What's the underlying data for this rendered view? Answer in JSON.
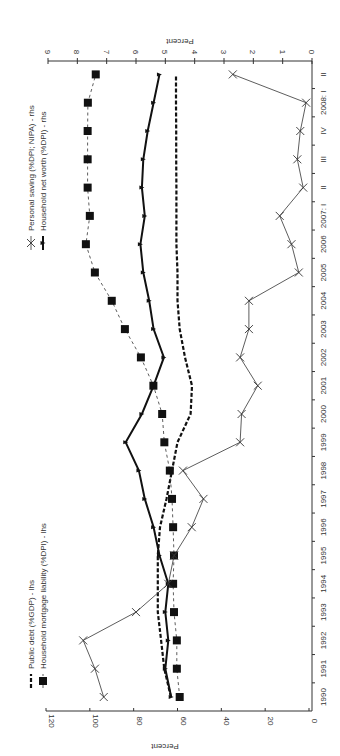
{
  "chart_data": {
    "type": "line",
    "orientation": "rotated-90-clockwise",
    "title": "",
    "categories": [
      "1990",
      "1991",
      "1992",
      "1993",
      "1994",
      "1995",
      "1996",
      "1997",
      "1998",
      "1999",
      "2000",
      "2001",
      "2002",
      "2003",
      "2004",
      "2005",
      "2006",
      "2007: I",
      "II",
      "III",
      "IV",
      "2008: I",
      "II"
    ],
    "left_axis": {
      "label": "Percent",
      "range": [
        0,
        120
      ],
      "ticks": [
        "0",
        "20",
        "40",
        "60",
        "80",
        "100",
        "120"
      ]
    },
    "right_axis": {
      "label": "Percent",
      "range": [
        0,
        9
      ],
      "ticks": [
        "0",
        "1",
        "2",
        "3",
        "4",
        "5",
        "6",
        "7",
        "8",
        "9"
      ]
    },
    "series": [
      {
        "name": "Public debt (%GDP) - lhs",
        "axis": "left",
        "style": "thick-dashed",
        "marker": "none",
        "values": [
          63,
          66,
          67.5,
          69,
          69,
          69,
          68,
          65,
          62.5,
          60,
          54,
          53.4,
          56.6,
          59,
          60,
          60,
          60.5,
          60.5,
          60.5,
          60.6,
          60.6,
          60.7,
          60.7
        ]
      },
      {
        "name": "Household mortgage liability (%DPI) - lhs",
        "axis": "left",
        "style": "thin-dashed",
        "marker": "square",
        "values": [
          59,
          60.3,
          60.3,
          61.6,
          62,
          61.6,
          62,
          62.5,
          63.5,
          66,
          67,
          71,
          76.7,
          84,
          90,
          97.7,
          101.8,
          100,
          101,
          101,
          101,
          100.9,
          97.3
        ]
      },
      {
        "name": "Personal saving (%DPI; NIPA) - rhs",
        "axis": "right",
        "style": "thin-solid",
        "marker": "x",
        "values": [
          7.1,
          7.4,
          7.8,
          6.0,
          4.9,
          4.7,
          4.1,
          3.7,
          4.4,
          2.45,
          2.4,
          1.85,
          2.45,
          2.15,
          2.15,
          0.45,
          0.7,
          1.1,
          0.3,
          0.5,
          0.4,
          0.2,
          2.7
        ]
      },
      {
        "name": "Household net worth (%DPI) - rhs",
        "axis": "right",
        "style": "thick-solid",
        "marker": "triangle",
        "values": [
          4.8,
          5.0,
          4.9,
          5.0,
          4.9,
          5.2,
          5.4,
          5.7,
          5.9,
          6.35,
          5.8,
          5.4,
          5.05,
          5.4,
          5.55,
          5.75,
          5.85,
          5.7,
          5.8,
          5.75,
          5.6,
          5.4,
          5.2
        ]
      }
    ],
    "legend": {
      "left_group": [
        "Public debt (%GDP) - lhs",
        "Household mortgage liability (%DPI) - lhs"
      ],
      "right_group": [
        "Personal saving (%DPI; NIPA) - rhs",
        "Household net worth (%DPI) - rhs"
      ]
    },
    "grid": false
  }
}
